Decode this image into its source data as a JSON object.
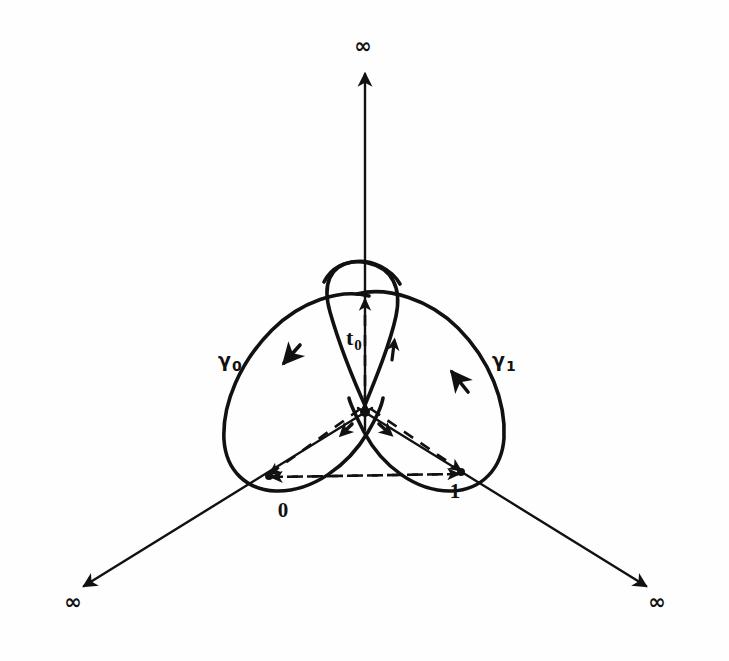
{
  "figure": {
    "background_color": "#fefefe",
    "ink_color": "#111111",
    "stroke_width_curve": 3.6,
    "stroke_width_axis": 2.4,
    "stroke_width_dashed": 2.6,
    "dash_pattern": "11 9"
  },
  "labels": {
    "infinity_top": "∞",
    "infinity_left": "∞",
    "infinity_right": "∞",
    "point_zero": "0",
    "point_one": "1",
    "gamma_zero_letter": "γ",
    "gamma_zero_index": "0",
    "gamma_one_letter": "γ",
    "gamma_one_index": "1",
    "basepoint_letter": "t",
    "basepoint_index": "0"
  },
  "geometry": {
    "center": {
      "x": 365,
      "y": 412
    },
    "axes": [
      {
        "name": "axis-up",
        "from": [
          365,
          412
        ],
        "to": [
          365,
          70
        ],
        "label": "∞"
      },
      {
        "name": "axis-down-left",
        "from": [
          365,
          412
        ],
        "to": [
          80,
          588
        ],
        "label": "∞"
      },
      {
        "name": "axis-down-right",
        "from": [
          365,
          412
        ],
        "to": [
          650,
          588
        ],
        "label": "∞"
      }
    ],
    "punctures": [
      {
        "name": "zero",
        "x": 262,
        "y": 477,
        "label": "0"
      },
      {
        "name": "one",
        "x": 468,
        "y": 472,
        "label": "1"
      },
      {
        "name": "infinity",
        "x": 365,
        "y": 70,
        "label": "∞"
      }
    ],
    "basepoint": {
      "name": "t0",
      "x": 365,
      "y": 412
    },
    "loops": [
      {
        "name": "gamma-0",
        "around": "zero",
        "orientation": "clockwise",
        "label": "γ0"
      },
      {
        "name": "gamma-1",
        "around": "one",
        "orientation": "counterclockwise",
        "label": "γ1"
      }
    ]
  }
}
